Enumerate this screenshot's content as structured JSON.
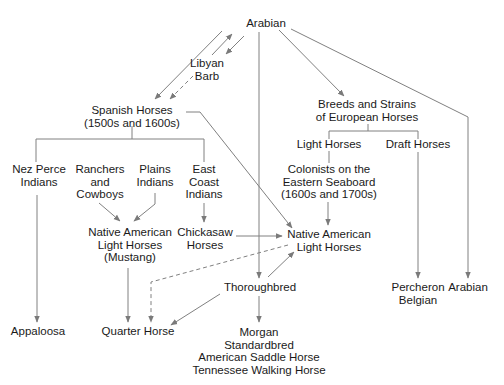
{
  "diagram": {
    "line_color": "#808080",
    "nodes": {
      "arabian_top": {
        "lines": [
          "Arabian"
        ]
      },
      "libyan_barb": {
        "lines": [
          "Libyan",
          "Barb"
        ]
      },
      "spanish_horses": {
        "lines": [
          "Spanish Horses",
          "(1500s and 1600s)"
        ]
      },
      "european_horses": {
        "lines": [
          "Breeds and Strains",
          "of European Horses"
        ]
      },
      "nez_perce": {
        "lines": [
          "Nez Perce",
          "Indians"
        ]
      },
      "ranchers": {
        "lines": [
          "Ranchers",
          "and",
          "Cowboys"
        ]
      },
      "plains": {
        "lines": [
          "Plains",
          "Indians"
        ]
      },
      "east_coast": {
        "lines": [
          "East",
          "Coast",
          "Indians"
        ]
      },
      "light_horses": {
        "lines": [
          "Light Horses"
        ]
      },
      "draft_horses": {
        "lines": [
          "Draft Horses"
        ]
      },
      "colonists": {
        "lines": [
          "Colonists on the",
          "Eastern Seaboard",
          "(1600s and 1700s)"
        ]
      },
      "mustang": {
        "lines": [
          "Native American",
          "Light Horses",
          "(Mustang)"
        ]
      },
      "chickasaw": {
        "lines": [
          "Chickasaw",
          "Horses"
        ]
      },
      "native_light": {
        "lines": [
          "Native American",
          "Light Horses"
        ]
      },
      "thoroughbred": {
        "lines": [
          "Thoroughbred"
        ]
      },
      "appaloosa": {
        "lines": [
          "Appaloosa"
        ]
      },
      "quarter_horse": {
        "lines": [
          "Quarter Horse"
        ]
      },
      "morgan_group": {
        "lines": [
          "Morgan",
          "Standardbred",
          "American Saddle Horse",
          "Tennessee Walking Horse"
        ]
      },
      "percheron_belgian": {
        "lines": [
          "Percheron",
          "Belgian"
        ]
      },
      "arabian_bottom": {
        "lines": [
          "Arabian"
        ]
      }
    },
    "edges": [
      {
        "from": "Arabian",
        "to": "Spanish Horses",
        "style": "solid"
      },
      {
        "from": "Libyan Barb",
        "to": "Arabian",
        "style": "solid"
      },
      {
        "from": "Arabian",
        "to": "Libyan Barb",
        "style": "solid"
      },
      {
        "from": "Libyan Barb",
        "to": "Spanish Horses",
        "style": "dashed"
      },
      {
        "from": "Arabian",
        "to": "Breeds and Strains of European Horses",
        "style": "solid"
      },
      {
        "from": "Arabian",
        "to": "Thoroughbred",
        "style": "solid"
      },
      {
        "from": "Arabian",
        "to": "Arabian",
        "style": "solid"
      },
      {
        "from": "Spanish Horses",
        "to": "Native American Light Horses",
        "style": "solid"
      },
      {
        "from": "Spanish Horses",
        "to": [
          "Nez Perce Indians",
          "Ranchers and Cowboys",
          "Plains Indians",
          "East Coast Indians"
        ],
        "style": "bracket"
      },
      {
        "from": "Ranchers and Cowboys",
        "to": "Native American Light Horses (Mustang)",
        "style": "solid"
      },
      {
        "from": "Plains Indians",
        "to": "Native American Light Horses (Mustang)",
        "style": "solid"
      },
      {
        "from": "East Coast Indians",
        "to": "Chickasaw Horses",
        "style": "solid"
      },
      {
        "from": "Chickasaw Horses",
        "to": "Native American Light Horses",
        "style": "solid"
      },
      {
        "from": "Breeds and Strains of European Horses",
        "to": [
          "Light Horses",
          "Draft Horses"
        ],
        "style": "bracket"
      },
      {
        "from": "Light Horses",
        "to": "Colonists on the Eastern Seaboard",
        "style": "solid"
      },
      {
        "from": "Colonists on the Eastern Seaboard",
        "to": "Native American Light Horses",
        "style": "solid"
      },
      {
        "from": "Draft Horses",
        "to": "Percheron Belgian",
        "style": "solid"
      },
      {
        "from": "Nez Perce Indians",
        "to": "Appaloosa",
        "style": "solid"
      },
      {
        "from": "Native American Light Horses (Mustang)",
        "to": "Quarter Horse",
        "style": "solid"
      },
      {
        "from": "Native American Light Horses",
        "to": "Quarter Horse",
        "style": "dashed"
      },
      {
        "from": "Thoroughbred",
        "to": "Native American Light Horses",
        "style": "solid"
      },
      {
        "from": "Thoroughbred",
        "to": "Quarter Horse",
        "style": "solid"
      },
      {
        "from": "Thoroughbred",
        "to": "Morgan / Standardbred / American Saddle Horse / Tennessee Walking Horse",
        "style": "solid"
      }
    ]
  }
}
